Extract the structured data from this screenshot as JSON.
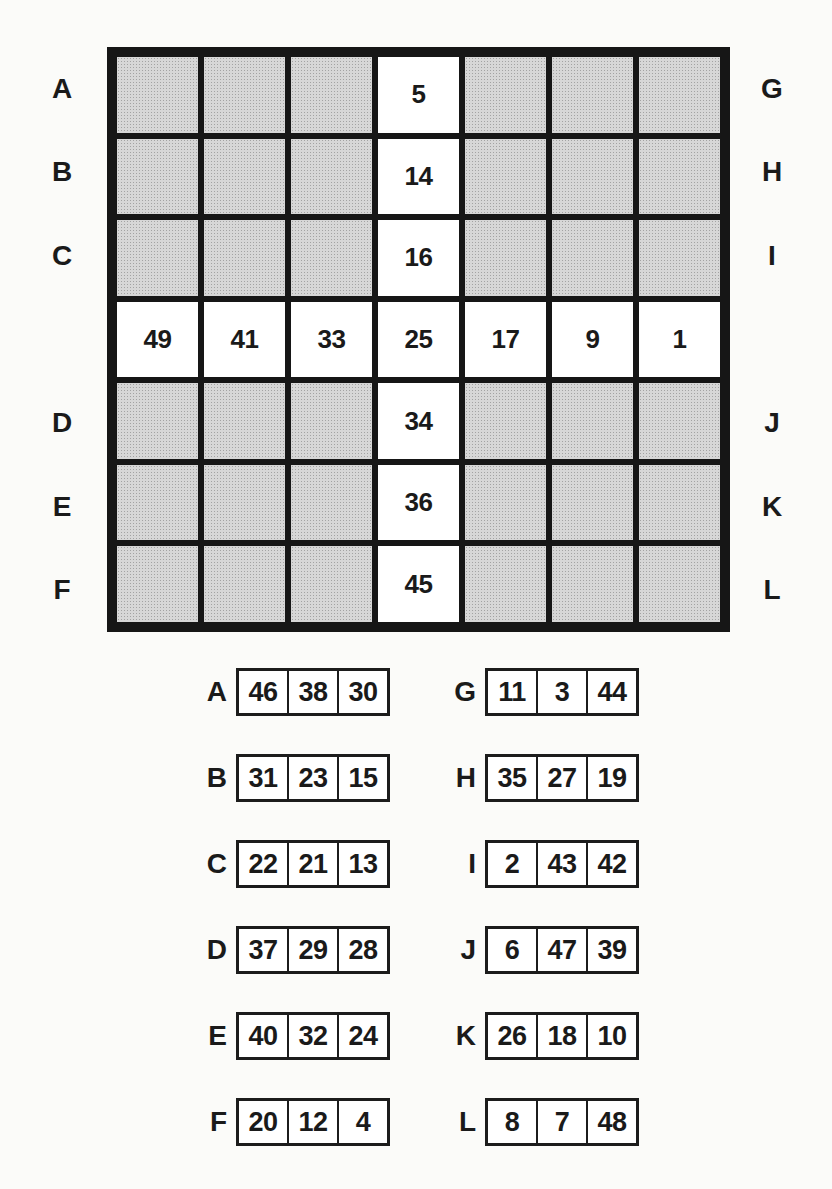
{
  "colors": {
    "paper": "#fbfbf9",
    "ink": "#1a1a1a",
    "frame_black": "#161616",
    "shaded_cell": "#d7d7d7",
    "white_cell": "#ffffff"
  },
  "board": {
    "note": "7x7 grid; empty cell string means shaded halftone cell; non-empty means white cell showing that number",
    "rows": [
      {
        "left_label": "A",
        "right_label": "G",
        "cells": [
          "",
          "",
          "",
          "5",
          "",
          "",
          ""
        ]
      },
      {
        "left_label": "B",
        "right_label": "H",
        "cells": [
          "",
          "",
          "",
          "14",
          "",
          "",
          ""
        ]
      },
      {
        "left_label": "C",
        "right_label": "I",
        "cells": [
          "",
          "",
          "",
          "16",
          "",
          "",
          ""
        ]
      },
      {
        "left_label": "",
        "right_label": "",
        "cells": [
          "49",
          "41",
          "33",
          "25",
          "17",
          "9",
          "1"
        ]
      },
      {
        "left_label": "D",
        "right_label": "J",
        "cells": [
          "",
          "",
          "",
          "34",
          "",
          "",
          ""
        ]
      },
      {
        "left_label": "E",
        "right_label": "K",
        "cells": [
          "",
          "",
          "",
          "36",
          "",
          "",
          ""
        ]
      },
      {
        "left_label": "F",
        "right_label": "L",
        "cells": [
          "",
          "",
          "",
          "45",
          "",
          "",
          ""
        ]
      }
    ]
  },
  "answer_strips": {
    "rows": [
      {
        "left": {
          "label": "A",
          "values": [
            "46",
            "38",
            "30"
          ]
        },
        "right": {
          "label": "G",
          "values": [
            "11",
            "3",
            "44"
          ]
        }
      },
      {
        "left": {
          "label": "B",
          "values": [
            "31",
            "23",
            "15"
          ]
        },
        "right": {
          "label": "H",
          "values": [
            "35",
            "27",
            "19"
          ]
        }
      },
      {
        "left": {
          "label": "C",
          "values": [
            "22",
            "21",
            "13"
          ]
        },
        "right": {
          "label": "I",
          "values": [
            "2",
            "43",
            "42"
          ]
        }
      },
      {
        "left": {
          "label": "D",
          "values": [
            "37",
            "29",
            "28"
          ]
        },
        "right": {
          "label": "J",
          "values": [
            "6",
            "47",
            "39"
          ]
        }
      },
      {
        "left": {
          "label": "E",
          "values": [
            "40",
            "32",
            "24"
          ]
        },
        "right": {
          "label": "K",
          "values": [
            "26",
            "18",
            "10"
          ]
        }
      },
      {
        "left": {
          "label": "F",
          "values": [
            "20",
            "12",
            "4"
          ]
        },
        "right": {
          "label": "L",
          "values": [
            "8",
            "7",
            "48"
          ]
        }
      }
    ]
  }
}
